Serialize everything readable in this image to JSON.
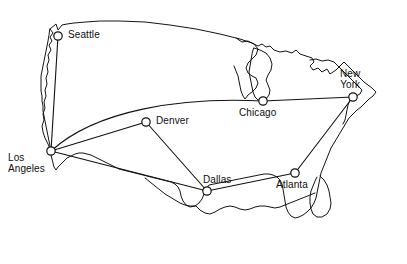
{
  "figure": {
    "name": "us-airline-network-map",
    "width": 407,
    "height": 264,
    "background_color": "#ffffff",
    "outline_color": "#141414",
    "edge_color": "#111111",
    "node_fill_color": "#ffffff",
    "node_stroke_color": "#111111",
    "label_color": "#0d0d0d"
  },
  "cities": [
    {
      "id": "seattle",
      "label": "Seattle",
      "x": 58,
      "y": 36,
      "label_x": 68,
      "label_y": 30,
      "label_align": "lbl-right",
      "lines": 1
    },
    {
      "id": "denver",
      "label": "Denver",
      "x": 146,
      "y": 122,
      "label_x": 156,
      "label_y": 116,
      "label_align": "lbl-right",
      "lines": 1
    },
    {
      "id": "chicago",
      "label": "Chicago",
      "x": 263,
      "y": 101,
      "label_x": 239,
      "label_y": 108,
      "label_align": "lbl-center",
      "lines": 1
    },
    {
      "id": "new-york",
      "label": "New\nYork",
      "x": 353,
      "y": 97,
      "label_x": 340,
      "label_y": 68,
      "label_align": "lbl-center",
      "lines": 2
    },
    {
      "id": "los-angeles",
      "label": "Los\nAngeles",
      "x": 51,
      "y": 151,
      "label_x": 8,
      "label_y": 152,
      "label_align": "lbl-right",
      "lines": 2
    },
    {
      "id": "dallas",
      "label": "Dallas",
      "x": 207,
      "y": 191,
      "label_x": 203,
      "label_y": 175,
      "label_align": "lbl-right",
      "lines": 1
    },
    {
      "id": "atlanta",
      "label": "Atlanta",
      "x": 295,
      "y": 173,
      "label_x": 276,
      "label_y": 180,
      "label_align": "lbl-center",
      "lines": 1
    }
  ],
  "routes": [
    {
      "id": "seattle-los-angeles",
      "from": "Seattle",
      "to": "Los Angeles",
      "path": "M 58 36 L 51 151",
      "curved": false
    },
    {
      "id": "los-angeles-denver",
      "from": "Los Angeles",
      "to": "Denver",
      "path": "M 51 151 L 146 122",
      "curved": false
    },
    {
      "id": "los-angeles-chicago",
      "from": "Los Angeles",
      "to": "Chicago",
      "path": "M 51 151 C 96 110, 180 97, 263 101",
      "curved": true
    },
    {
      "id": "los-angeles-dallas",
      "from": "Los Angeles",
      "to": "Dallas",
      "path": "M 51 151 L 207 191",
      "curved": false
    },
    {
      "id": "denver-dallas",
      "from": "Denver",
      "to": "Dallas",
      "path": "M 146 122 L 207 191",
      "curved": false
    },
    {
      "id": "dallas-atlanta",
      "from": "Dallas",
      "to": "Atlanta",
      "path": "M 207 191 L 295 173",
      "curved": false
    },
    {
      "id": "chicago-new-york",
      "from": "Chicago",
      "to": "New York",
      "path": "M 263 101 L 353 97",
      "curved": false
    },
    {
      "id": "atlanta-new-york",
      "from": "Atlanta",
      "to": "New York",
      "path": "M 295 173 L 353 97",
      "curved": false
    }
  ],
  "node_radius": 4.2
}
